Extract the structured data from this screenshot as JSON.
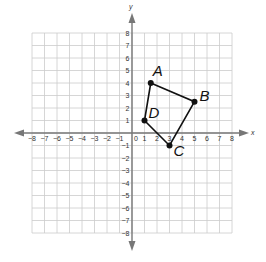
{
  "chart_data": {
    "type": "scatter",
    "title": "",
    "xlabel": "x",
    "ylabel": "y",
    "xlim": [
      -8,
      8
    ],
    "ylim": [
      -8,
      8
    ],
    "grid": true,
    "x_ticks": [
      -8,
      -7,
      -6,
      -5,
      -4,
      -3,
      -2,
      -1,
      1,
      2,
      3,
      4,
      5,
      6,
      7,
      8
    ],
    "y_ticks": [
      -8,
      -7,
      -6,
      -5,
      -4,
      -3,
      -2,
      -1,
      1,
      2,
      3,
      4,
      5,
      6,
      7,
      8
    ],
    "origin_label": "0",
    "points": [
      {
        "label": "A",
        "x": 1.5,
        "y": 4
      },
      {
        "label": "B",
        "x": 5,
        "y": 2.5
      },
      {
        "label": "C",
        "x": 3,
        "y": -1
      },
      {
        "label": "D",
        "x": 1,
        "y": 1
      }
    ],
    "polygon": [
      "A",
      "B",
      "C",
      "D"
    ]
  },
  "graph": {
    "x_axis_label": "x",
    "y_axis_label": "y",
    "origin_label": "0",
    "colors": {
      "grid": "#cccccc",
      "axis": "#777777",
      "shape": "#111111"
    }
  }
}
